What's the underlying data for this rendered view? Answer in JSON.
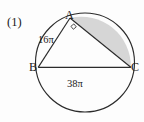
{
  "figure": {
    "problem_number": "(1)",
    "vertices": [
      {
        "name": "A",
        "label": "A",
        "x": 70,
        "y": 18
      },
      {
        "name": "B",
        "label": "B",
        "x": 38,
        "y": 67
      },
      {
        "name": "C",
        "label": "C",
        "x": 131,
        "y": 67
      }
    ],
    "arc_labels": [
      {
        "name": "arc-AB",
        "label": "16π",
        "value": "16π"
      },
      {
        "name": "arc-BC",
        "label": "38π",
        "value": "38π"
      }
    ],
    "right_angle_at": "A",
    "shaded_region": "segment-AC",
    "colors": {
      "stroke": "#2b2b2b",
      "shade_fill": "#d6d6d6",
      "background": "#fdfdfd",
      "text": "#1a1a1a"
    },
    "circle": {
      "cx": 85,
      "cy": 62.5,
      "r": 49.5
    }
  }
}
